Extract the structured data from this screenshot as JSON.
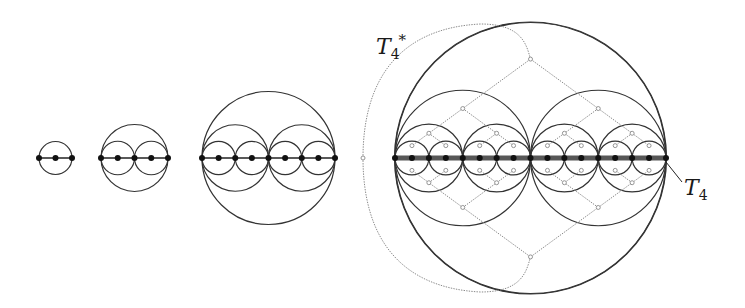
{
  "diagram": {
    "colors": {
      "circle_stroke": "#333333",
      "dot_fill": "#111111",
      "line_stroke": "#222222",
      "thick_line": "#3a3a3a",
      "dual_stroke": "#8a8a8a",
      "node_fill": "#ffffff"
    },
    "baseline_y": 158,
    "figures": [
      {
        "id": "level-1",
        "x_start": 39,
        "x_end": 72,
        "levels": 1
      },
      {
        "id": "level-2",
        "x_start": 101,
        "x_end": 168,
        "levels": 2
      },
      {
        "id": "level-3",
        "x_start": 202,
        "x_end": 335,
        "levels": 3
      },
      {
        "id": "level-4",
        "x_start": 395,
        "x_end": 666,
        "levels": 4,
        "thick_line": true,
        "outer_circle_radius": 136,
        "dual_tree": true
      }
    ],
    "dual_outer_node": {
      "x": 363,
      "y": 158
    },
    "labels": {
      "t4_star": {
        "base": "T",
        "sub": "4",
        "sup": "*"
      },
      "t4": {
        "base": "T",
        "sub": "4"
      }
    }
  }
}
